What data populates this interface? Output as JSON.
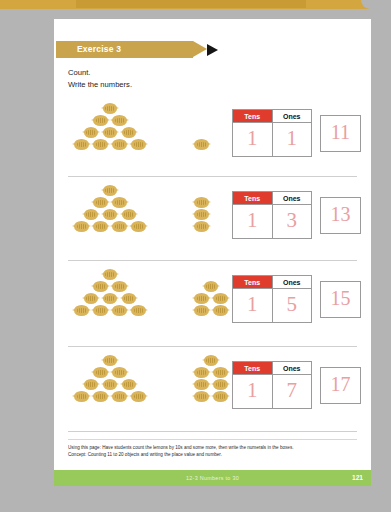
{
  "banner": {
    "exercise_label": "Exercise 3"
  },
  "instructions": {
    "line1": "Count.",
    "line2": "Write the numbers."
  },
  "table_headers": {
    "tens": "Tens",
    "ones": "Ones"
  },
  "colors": {
    "page_background": "#b4b4b4",
    "paper": "#ffffff",
    "banner_gold": "#c9a44c",
    "tens_header_red": "#e03c2e",
    "numeral_pink": "#e8a0a2",
    "lemon_gold": "#d9b45a",
    "footer_green": "#97ca5b"
  },
  "exercises": [
    {
      "id": "exercise-row-1",
      "tens": "1",
      "ones": "1",
      "answer": "11",
      "group_ten_rows": [
        1,
        2,
        3,
        4
      ],
      "extra_rows": [
        1
      ],
      "extra_count": 1
    },
    {
      "id": "exercise-row-2",
      "tens": "1",
      "ones": "3",
      "answer": "13",
      "group_ten_rows": [
        1,
        2,
        3,
        4
      ],
      "extra_rows": [
        1,
        1,
        1
      ],
      "extra_count": 3
    },
    {
      "id": "exercise-row-3",
      "tens": "1",
      "ones": "5",
      "answer": "15",
      "group_ten_rows": [
        1,
        2,
        3,
        4
      ],
      "extra_rows": [
        1,
        2,
        2
      ],
      "extra_count": 5
    },
    {
      "id": "exercise-row-4",
      "tens": "1",
      "ones": "7",
      "answer": "17",
      "group_ten_rows": [
        1,
        2,
        3,
        4
      ],
      "extra_rows": [
        1,
        2,
        2,
        2
      ],
      "extra_count": 7
    }
  ],
  "footer": {
    "note_line1": "Using this page: Have students count the lemons by 10s and some more, then write the numerals in the boxes.",
    "note_line2": "Concept: Counting 11 to 20 objects and writing the place value and number.",
    "chapter": "12-3  Numbers to 30",
    "page_number": "121"
  }
}
